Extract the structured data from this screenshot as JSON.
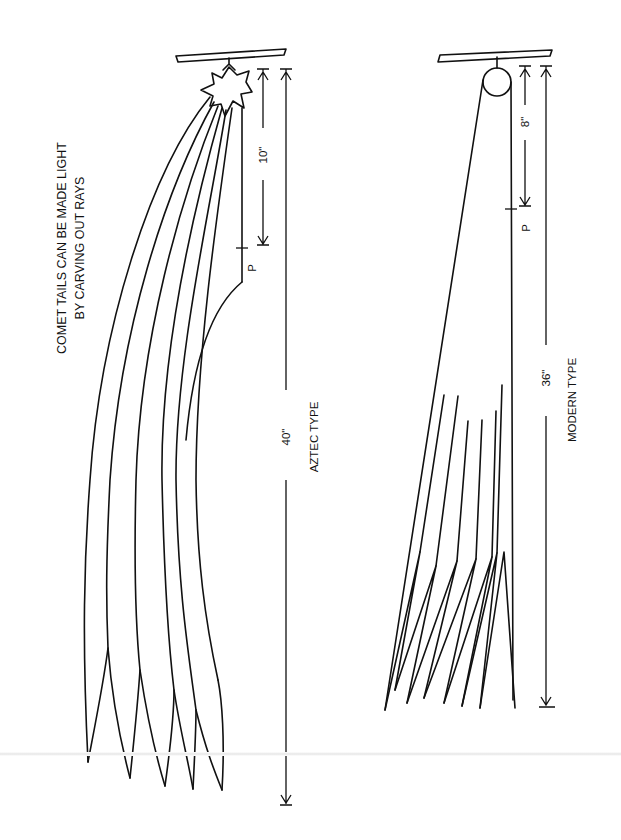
{
  "diagram": {
    "note": {
      "line1": "COMET TAILS CAN BE MADE LIGHT",
      "line2": "BY CARVING OUT RAYS"
    },
    "aztec": {
      "title": "AZTEC TYPE",
      "pivot_label": "P",
      "short_dim": "10\"",
      "long_dim": "40\"",
      "head_shape": "star",
      "tail_count": 6
    },
    "modern": {
      "title": "MODERN TYPE",
      "pivot_label": "P",
      "short_dim": "8\"",
      "long_dim": "36\"",
      "head_shape": "circle",
      "ray_count": 7
    },
    "colors": {
      "ink": "#111111",
      "paper": "#ffffff"
    }
  }
}
